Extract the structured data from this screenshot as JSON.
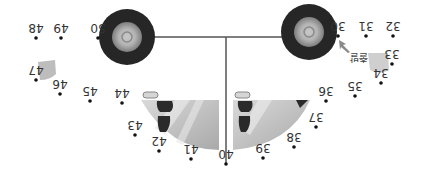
{
  "puzzle": {
    "type": "dot-to-dot",
    "orientation": "rotated-180",
    "subject": "car",
    "start_label": "출발",
    "colors": {
      "tire": "#2b2b2b",
      "hub_outer": "#9a9a9a",
      "hub_inner": "#d0d0d0",
      "window": "#bdbdbd",
      "window_light": "#e6e6e6",
      "seat": "#2a2a2a",
      "light": "#c9c9c9",
      "line": "#555555",
      "dot": "#111111",
      "arrow": "#8a8a8a"
    },
    "dots": [
      {
        "n": "30",
        "x": 338,
        "y": 36
      },
      {
        "n": "31",
        "x": 366,
        "y": 36
      },
      {
        "n": "32",
        "x": 393,
        "y": 36
      },
      {
        "n": "33",
        "x": 392,
        "y": 64
      },
      {
        "n": "34",
        "x": 381,
        "y": 83
      },
      {
        "n": "35",
        "x": 355,
        "y": 96
      },
      {
        "n": "36",
        "x": 326,
        "y": 101
      },
      {
        "n": "37",
        "x": 316,
        "y": 127
      },
      {
        "n": "38",
        "x": 294,
        "y": 147
      },
      {
        "n": "39",
        "x": 263,
        "y": 158
      },
      {
        "n": "40",
        "x": 226,
        "y": 164
      },
      {
        "n": "41",
        "x": 191,
        "y": 159
      },
      {
        "n": "42",
        "x": 159,
        "y": 151
      },
      {
        "n": "43",
        "x": 135,
        "y": 135
      },
      {
        "n": "44",
        "x": 122,
        "y": 103
      },
      {
        "n": "45",
        "x": 90,
        "y": 101
      },
      {
        "n": "46",
        "x": 60,
        "y": 94
      },
      {
        "n": "47",
        "x": 36,
        "y": 80
      },
      {
        "n": "48",
        "x": 36,
        "y": 38
      },
      {
        "n": "49",
        "x": 61,
        "y": 38
      },
      {
        "n": "50",
        "x": 98,
        "y": 38
      }
    ]
  }
}
